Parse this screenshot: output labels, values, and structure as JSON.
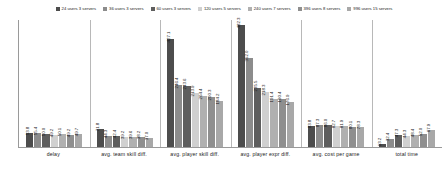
{
  "chart_data": {
    "type": "bar",
    "title": "",
    "xlabel": "",
    "ylabel": "",
    "grid": false,
    "legend_position": "top-center",
    "ylim": [
      0,
      500
    ],
    "categories": [
      "delay",
      "avg. team skill diff.",
      "avg. player skill diff.",
      "avg. player expr diff.",
      "avg. cost per game",
      "total time"
    ],
    "series": [
      {
        "name": "24 users 3 servers",
        "color": "#4d4d4d",
        "values": [
          53.8,
          71.8,
          427.1,
          482.3,
          83.8,
          13.2
        ]
      },
      {
        "name": "36 users 3 servers",
        "color": "#8c8c8c",
        "values": [
          55.4,
          44.3,
          246.4,
          352.0,
          87.3,
          32.4
        ]
      },
      {
        "name": "60 users 3 servers",
        "color": "#5e5e5e",
        "values": [
          50.0,
          42.4,
          243.6,
          235.5,
          86.0,
          47.3
        ]
      },
      {
        "name": "120 users 5 servers",
        "color": "#d0d0d0",
        "values": [
          49.2,
          39.2,
          213.9,
          218.3,
          82.7,
          44.3
        ]
      },
      {
        "name": "240 users 7 servers",
        "color": "#b0b0b0",
        "values": [
          50.1,
          39.6,
          204.4,
          191.4,
          81.9,
          48.4
        ]
      },
      {
        "name": "396 users 8 servers",
        "color": "#8f8f8f",
        "values": [
          49.2,
          38.2,
          200.3,
          190.4,
          80.1,
          52.0
        ]
      },
      {
        "name": "996 users 15 servers",
        "color": "#a8a8a8",
        "values": [
          49.7,
          37.0,
          184.2,
          176.9,
          78.3,
          67.9
        ]
      }
    ],
    "value_labels": {
      "delay": [
        "53.8",
        "55.4",
        "50.0",
        "49.2",
        "50.1",
        "49.2",
        "49.7"
      ],
      "avg. team skill diff.": [
        "71.8",
        "44.3",
        "42.4",
        "39.2",
        "39.6",
        "38.2",
        "37.0"
      ],
      "avg. player skill diff.": [
        "427.1",
        "246.4",
        "243.6",
        "213.9",
        "204.4",
        "200.3",
        "184.2"
      ],
      "avg. player expr diff.": [
        "482.3",
        "352.0",
        "235.5",
        "218.3",
        "191.4",
        "190.4",
        "176.9"
      ],
      "avg. cost per game": [
        "83.8",
        "87.3",
        "86.0",
        "82.7",
        "81.9",
        "80.1",
        "78.3"
      ],
      "total time": [
        "13.2",
        "32.4",
        "47.3",
        "44.3",
        "48.4",
        "52.0",
        "67.9"
      ]
    }
  }
}
